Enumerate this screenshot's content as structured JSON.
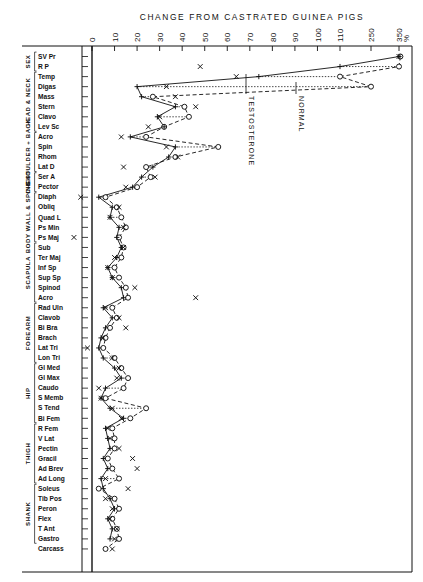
{
  "chart_data": {
    "type": "line",
    "title": "CHANGE  FROM  CASTRATED  GUINEA  PIGS",
    "xlabel": "%",
    "ylabel": "",
    "grid": false,
    "legend_position": "inline-annotations",
    "axis_note": "Horizontal axis is piecewise: linear 0-110 then compressed steps to 250 and 350",
    "xticks": [
      "0",
      "10",
      "20",
      "30",
      "40",
      "50",
      "60",
      "70",
      "80",
      "90",
      "100",
      "110",
      "250",
      "350"
    ],
    "xtick_values": [
      0,
      10,
      20,
      30,
      40,
      50,
      60,
      70,
      80,
      90,
      100,
      110,
      250,
      350
    ],
    "x_unit": "%",
    "annotations": [
      {
        "text": "TESTOSTERONE",
        "points_to_series": "testosterone"
      },
      {
        "text": "NORMAL",
        "points_to_series": "normal"
      },
      {
        "text": "%",
        "role": "axis-unit"
      }
    ],
    "series": [
      {
        "name": "testosterone",
        "marker": "plus",
        "line": "solid"
      },
      {
        "name": "x-series",
        "marker": "x",
        "line": "none"
      },
      {
        "name": "normal",
        "marker": "circle",
        "line": "dashed"
      }
    ],
    "groups": [
      {
        "label": "SEX",
        "rows": [
          "SV Pr",
          "R P"
        ]
      },
      {
        "label": "HEAD & NECK",
        "rows": [
          "Temp",
          "Digas",
          "Mass",
          "Stern",
          "Clavo",
          "Lev Sc"
        ]
      },
      {
        "label": "SHOULDER + BACK",
        "rows": [
          "Acro",
          "Spin",
          "Rhom",
          "Lat D"
        ]
      },
      {
        "label": "CHEST",
        "rows": [
          "Ser A",
          "Pector"
        ]
      },
      {
        "label": "BODY WALL & SPINE",
        "rows": [
          "Diaph",
          "Obliq",
          "Quad L",
          "Ps Min",
          "Ps Maj"
        ]
      },
      {
        "label": "SCAPULA",
        "rows": [
          "Sub",
          "Ter Maj",
          "Inf Sp",
          "Sup Sp",
          "Spinod",
          "Acro"
        ]
      },
      {
        "label": "FOREARM",
        "rows": [
          "Rad Uln",
          "Clavob",
          "Bi Bra",
          "Brach",
          "Lat Tri",
          "Lon Tri"
        ]
      },
      {
        "label": "HIP",
        "rows": [
          "Gl Med",
          "Gl Max",
          "Caudo",
          "S Memb",
          "S Tend",
          "Bi Fem"
        ]
      },
      {
        "label": "THIGH",
        "rows": [
          "R Fem",
          "V Lat",
          "Pectin",
          "Gracil",
          "Ad Brev",
          "Ad Long"
        ]
      },
      {
        "label": "SHANK",
        "rows": [
          "Soleus",
          "Tib Pos",
          "Peron",
          "Flex",
          "T Ant",
          "Gastro"
        ]
      },
      {
        "label": "",
        "rows": [
          "Carcass"
        ]
      }
    ],
    "rows": [
      {
        "label": "SV Pr",
        "testosterone": 350,
        "x": 350,
        "normal": 355
      },
      {
        "label": "R P",
        "testosterone": 110,
        "x": 48,
        "normal": 350
      },
      {
        "label": "Temp",
        "testosterone": 74,
        "x": 64,
        "normal": 110
      },
      {
        "label": "Digas",
        "testosterone": 20,
        "x": 33,
        "normal": 250
      },
      {
        "label": "Mass",
        "testosterone": 22,
        "x": 37,
        "normal": 27
      },
      {
        "label": "Stern",
        "testosterone": 37,
        "x": 46,
        "normal": 41
      },
      {
        "label": "Clavo",
        "testosterone": 29,
        "x": 30,
        "normal": 43
      },
      {
        "label": "Lev Sc",
        "testosterone": 32,
        "x": 25,
        "normal": 32
      },
      {
        "label": "Acro",
        "testosterone": 17,
        "x": 13,
        "normal": 24
      },
      {
        "label": "Spin",
        "testosterone": 37,
        "x": 33,
        "normal": 56
      },
      {
        "label": "Rhom",
        "testosterone": 34,
        "x": 38,
        "normal": 37
      },
      {
        "label": "Lat D",
        "testosterone": 27,
        "x": 14,
        "normal": 24
      },
      {
        "label": "Ser A",
        "testosterone": 22,
        "x": 28,
        "normal": 26
      },
      {
        "label": "Pector",
        "testosterone": 18,
        "x": 15,
        "normal": 20
      },
      {
        "label": "Diaph",
        "testosterone": 3,
        "x": -5,
        "normal": 6
      },
      {
        "label": "Obliq",
        "testosterone": 9,
        "x": 12,
        "normal": 11
      },
      {
        "label": "Quad L",
        "testosterone": 8,
        "x": 8,
        "normal": 13
      },
      {
        "label": "Ps Min",
        "testosterone": 12,
        "x": 14,
        "normal": 15
      },
      {
        "label": "Ps Maj",
        "testosterone": 11,
        "x": -8,
        "normal": 12
      },
      {
        "label": "Sub",
        "testosterone": 13,
        "x": 14,
        "normal": 14
      },
      {
        "label": "Ter Maj",
        "testosterone": 11,
        "x": 10,
        "normal": 13
      },
      {
        "label": "Inf Sp",
        "testosterone": 7,
        "x": 7,
        "normal": 10
      },
      {
        "label": "Sup Sp",
        "testosterone": 9,
        "x": 9,
        "normal": 12
      },
      {
        "label": "Spinod",
        "testosterone": 13,
        "x": 19,
        "normal": 15
      },
      {
        "label": "Acro",
        "testosterone": 14,
        "x": 46,
        "normal": 16
      },
      {
        "label": "Rad Uln",
        "testosterone": 5,
        "x": 6,
        "normal": 9
      },
      {
        "label": "Clavob",
        "testosterone": 9,
        "x": 12,
        "normal": 11
      },
      {
        "label": "Bi Bra",
        "testosterone": 6,
        "x": 15,
        "normal": 8
      },
      {
        "label": "Brach",
        "testosterone": 4,
        "x": 5,
        "normal": 6
      },
      {
        "label": "Lat Tri",
        "testosterone": 3,
        "x": -2,
        "normal": 5
      },
      {
        "label": "Lon Tri",
        "testosterone": 5,
        "x": 9,
        "normal": 10
      },
      {
        "label": "Gl Med",
        "testosterone": 10,
        "x": 12,
        "normal": 13
      },
      {
        "label": "Gl Max",
        "testosterone": 13,
        "x": 11,
        "normal": 16
      },
      {
        "label": "Caudo",
        "testosterone": 6,
        "x": 3,
        "normal": 14
      },
      {
        "label": "S Memb",
        "testosterone": 4,
        "x": 4,
        "normal": 6
      },
      {
        "label": "S Tend",
        "testosterone": 8,
        "x": 9,
        "normal": 24
      },
      {
        "label": "Bi Fem",
        "testosterone": 14,
        "x": 13,
        "normal": 17
      },
      {
        "label": "R Fem",
        "testosterone": 6,
        "x": 7,
        "normal": 9
      },
      {
        "label": "V Lat",
        "testosterone": 7,
        "x": 8,
        "normal": 10
      },
      {
        "label": "Pectin",
        "testosterone": 8,
        "x": 12,
        "normal": 10
      },
      {
        "label": "Gracil",
        "testosterone": 5,
        "x": 18,
        "normal": 7
      },
      {
        "label": "Ad Brev",
        "testosterone": 7,
        "x": 20,
        "normal": 9
      },
      {
        "label": "Ad Long",
        "testosterone": 4,
        "x": 6,
        "normal": 12
      },
      {
        "label": "Soleus",
        "testosterone": 5,
        "x": 16,
        "normal": 3
      },
      {
        "label": "Tib Pos",
        "testosterone": 8,
        "x": 6,
        "normal": 10
      },
      {
        "label": "Peron",
        "testosterone": 10,
        "x": 9,
        "normal": 12
      },
      {
        "label": "Flex",
        "testosterone": 7,
        "x": 8,
        "normal": 9
      },
      {
        "label": "T Ant",
        "testosterone": 9,
        "x": 11,
        "normal": 11
      },
      {
        "label": "Gastro",
        "testosterone": 8,
        "x": 10,
        "normal": 12
      },
      {
        "label": "Carcass",
        "testosterone": null,
        "x": 9,
        "normal": 6
      }
    ]
  },
  "figure": {
    "title": "CHANGE  FROM  CASTRATED  GUINEA  PIGS",
    "unit_label": "%",
    "annotation_testosterone": "TESTOSTERONE",
    "annotation_normal": "NORMAL",
    "ticks": [
      "0",
      "10",
      "20",
      "30",
      "40",
      "50",
      "60",
      "70",
      "80",
      "90",
      "100",
      "110",
      "250",
      "350"
    ],
    "group_labels": [
      "SEX",
      "HEAD & NECK",
      "SHOULDER + BACK",
      "CHEST",
      "BODY WALL & SPINE",
      "SCAPULA",
      "FOREARM",
      "HIP",
      "THIGH",
      "SHANK"
    ],
    "row_labels": [
      "SV Pr",
      "R P",
      "Temp",
      "Digas",
      "Mass",
      "Stern",
      "Clavo",
      "Lev Sc",
      "Acro",
      "Spin",
      "Rhom",
      "Lat D",
      "Ser A",
      "Pector",
      "Diaph",
      "Obliq",
      "Quad L",
      "Ps Min",
      "Ps Maj",
      "Sub",
      "Ter Maj",
      "Inf Sp",
      "Sup Sp",
      "Spinod",
      "Acro",
      "Rad Uln",
      "Clavob",
      "Bi Bra",
      "Brach",
      "Lat Tri",
      "Lon Tri",
      "Gl Med",
      "Gl Max",
      "Caudo",
      "S Memb",
      "S Tend",
      "Bi Fem",
      "R Fem",
      "V Lat",
      "Pectin",
      "Gracil",
      "Ad Brev",
      "Ad Long",
      "Soleus",
      "Tib Pos",
      "Peron",
      "Flex",
      "T Ant",
      "Gastro",
      "Carcass"
    ],
    "colors": {
      "ink": "#111111",
      "paper": "#ffffff"
    }
  }
}
